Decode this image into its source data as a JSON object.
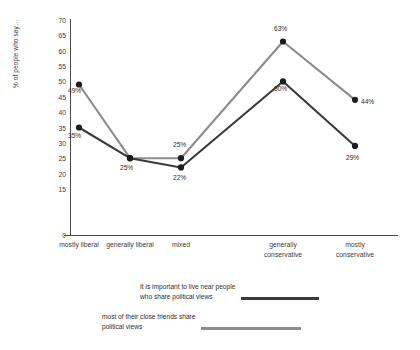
{
  "chart_data": {
    "type": "line",
    "title": "",
    "xlabel": "",
    "ylabel": "% of people who say…",
    "ylim": [
      0,
      70
    ],
    "ytick_step": 5,
    "grid": false,
    "legend_position": "bottom",
    "categories": [
      "mostly liberal",
      "generally liberal",
      "mixed",
      "generally conservative",
      "mostly conservative"
    ],
    "yticks": [
      "70",
      "65",
      "60",
      "55",
      "50",
      "45",
      "40",
      "35",
      "30",
      "25",
      "20",
      "15",
      "0"
    ],
    "ytick_values": [
      70,
      65,
      60,
      55,
      50,
      45,
      40,
      35,
      30,
      25,
      20,
      15,
      0
    ],
    "series": [
      {
        "name": "It is important to live near people who share political views",
        "name_line1": "It is important to live near people",
        "name_line2": "who share political views",
        "color": "#8c8c8c",
        "values": [
          49,
          25,
          25,
          63,
          44
        ],
        "labels": [
          "49%",
          "25%",
          "25%",
          "63%",
          "44%"
        ]
      },
      {
        "name": "most of their close friends share political views",
        "name_line1": "most of their close friends share",
        "name_line2": "political views",
        "color": "#3a3a3a",
        "values": [
          35,
          25,
          22,
          50,
          29
        ],
        "labels": [
          "35%",
          "25%",
          "22%",
          "50%",
          "29%"
        ]
      }
    ]
  },
  "legend": [
    {
      "line1": "It is important to live near people",
      "line2": "who share political views",
      "color": "#3a3a3a"
    },
    {
      "line1": "most of their close friends share",
      "line2": "political views",
      "color": "#8c8c8c"
    }
  ],
  "colors": {
    "dark_series": "#3a3a3a",
    "gray_series": "#8c8c8c",
    "axis": "#4a4a4a",
    "text": "#2e2e2e",
    "background": "#ffffff"
  }
}
